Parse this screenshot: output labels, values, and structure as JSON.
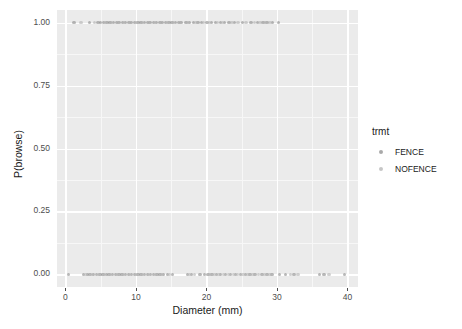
{
  "chart_data": {
    "type": "scatter",
    "title": "",
    "xlabel": "Diameter (mm)",
    "ylabel": "P(browse)",
    "xlim": [
      -1.2,
      41.5
    ],
    "ylim": [
      -0.05,
      1.05
    ],
    "xticks": [
      0,
      10,
      20,
      30,
      40
    ],
    "xtick_labels": [
      "0",
      "10",
      "20",
      "30",
      "40"
    ],
    "yticks": [
      0.0,
      0.25,
      0.5,
      0.75,
      1.0
    ],
    "ytick_labels": [
      "0.00",
      "0.25",
      "0.50",
      "0.75",
      "1.00"
    ],
    "grid": true,
    "grid_major_color": "#ffffff",
    "grid_minor_color": "#f7f7f7",
    "panel_background": "#ebebeb",
    "legend_position": "right",
    "legend_title": "trmt",
    "series": [
      {
        "name": "FENCE",
        "color": "#8c8c8c",
        "points": [
          [
            1.2,
            1.0
          ],
          [
            3.4,
            1.0
          ],
          [
            4.6,
            1.0
          ],
          [
            5.0,
            1.0
          ],
          [
            5.4,
            1.0
          ],
          [
            5.9,
            1.0
          ],
          [
            6.3,
            1.0
          ],
          [
            6.8,
            1.0
          ],
          [
            7.2,
            1.0
          ],
          [
            7.6,
            1.0
          ],
          [
            8.1,
            1.0
          ],
          [
            8.5,
            1.0
          ],
          [
            9.0,
            1.0
          ],
          [
            9.4,
            1.0
          ],
          [
            9.8,
            1.0
          ],
          [
            10.3,
            1.0
          ],
          [
            10.7,
            1.0
          ],
          [
            11.2,
            1.0
          ],
          [
            11.6,
            1.0
          ],
          [
            12.0,
            1.0
          ],
          [
            12.5,
            1.0
          ],
          [
            12.9,
            1.0
          ],
          [
            13.4,
            1.0
          ],
          [
            13.8,
            1.0
          ],
          [
            14.2,
            1.0
          ],
          [
            14.7,
            1.0
          ],
          [
            15.1,
            1.0
          ],
          [
            15.6,
            1.0
          ],
          [
            16.0,
            1.0
          ],
          [
            16.4,
            1.0
          ],
          [
            17.1,
            1.0
          ],
          [
            17.6,
            1.0
          ],
          [
            18.2,
            1.0
          ],
          [
            18.8,
            1.0
          ],
          [
            19.3,
            1.0
          ],
          [
            20.1,
            1.0
          ],
          [
            20.7,
            1.0
          ],
          [
            21.3,
            1.0
          ],
          [
            22.0,
            1.0
          ],
          [
            22.6,
            1.0
          ],
          [
            23.2,
            1.0
          ],
          [
            24.0,
            1.0
          ],
          [
            25.1,
            1.0
          ],
          [
            26.3,
            1.0
          ],
          [
            27.2,
            1.0
          ],
          [
            28.0,
            1.0
          ],
          [
            28.6,
            1.0
          ],
          [
            29.4,
            1.0
          ],
          [
            30.2,
            1.0
          ],
          [
            0.4,
            0.0
          ],
          [
            2.6,
            0.0
          ],
          [
            3.1,
            0.0
          ],
          [
            3.5,
            0.0
          ],
          [
            4.0,
            0.0
          ],
          [
            4.4,
            0.0
          ],
          [
            4.9,
            0.0
          ],
          [
            5.3,
            0.0
          ],
          [
            5.8,
            0.0
          ],
          [
            6.2,
            0.0
          ],
          [
            6.7,
            0.0
          ],
          [
            7.1,
            0.0
          ],
          [
            7.6,
            0.0
          ],
          [
            8.0,
            0.0
          ],
          [
            8.5,
            0.0
          ],
          [
            8.9,
            0.0
          ],
          [
            9.4,
            0.0
          ],
          [
            9.8,
            0.0
          ],
          [
            10.3,
            0.0
          ],
          [
            10.7,
            0.0
          ],
          [
            11.2,
            0.0
          ],
          [
            11.6,
            0.0
          ],
          [
            12.1,
            0.0
          ],
          [
            12.5,
            0.0
          ],
          [
            13.0,
            0.0
          ],
          [
            13.4,
            0.0
          ],
          [
            13.9,
            0.0
          ],
          [
            14.5,
            0.0
          ],
          [
            15.2,
            0.0
          ],
          [
            17.3,
            0.0
          ],
          [
            17.9,
            0.0
          ],
          [
            19.1,
            0.0
          ],
          [
            19.7,
            0.0
          ],
          [
            20.2,
            0.0
          ],
          [
            20.8,
            0.0
          ],
          [
            21.4,
            0.0
          ],
          [
            22.0,
            0.0
          ],
          [
            22.7,
            0.0
          ],
          [
            23.4,
            0.0
          ],
          [
            24.1,
            0.0
          ],
          [
            24.8,
            0.0
          ],
          [
            25.5,
            0.0
          ],
          [
            26.2,
            0.0
          ],
          [
            26.9,
            0.0
          ],
          [
            27.9,
            0.0
          ],
          [
            28.6,
            0.0
          ],
          [
            29.3,
            0.0
          ],
          [
            30.4,
            0.0
          ],
          [
            31.2,
            0.0
          ],
          [
            32.4,
            0.0
          ],
          [
            36.0,
            0.0
          ],
          [
            36.7,
            0.0
          ],
          [
            39.6,
            0.0
          ]
        ]
      },
      {
        "name": "NOFENCE",
        "color": "#b3b3b3",
        "points": [
          [
            2.2,
            1.0
          ],
          [
            4.1,
            1.0
          ],
          [
            5.6,
            1.0
          ],
          [
            6.5,
            1.0
          ],
          [
            7.4,
            1.0
          ],
          [
            8.3,
            1.0
          ],
          [
            9.2,
            1.0
          ],
          [
            10.0,
            1.0
          ],
          [
            10.9,
            1.0
          ],
          [
            11.8,
            1.0
          ],
          [
            12.7,
            1.0
          ],
          [
            13.6,
            1.0
          ],
          [
            14.4,
            1.0
          ],
          [
            15.3,
            1.0
          ],
          [
            16.2,
            1.0
          ],
          [
            17.4,
            1.0
          ],
          [
            18.5,
            1.0
          ],
          [
            19.6,
            1.0
          ],
          [
            20.4,
            1.0
          ],
          [
            21.6,
            1.0
          ],
          [
            22.3,
            1.0
          ],
          [
            23.6,
            1.0
          ],
          [
            24.5,
            1.0
          ],
          [
            25.6,
            1.0
          ],
          [
            26.8,
            1.0
          ],
          [
            27.6,
            1.0
          ],
          [
            28.3,
            1.0
          ],
          [
            29.0,
            1.0
          ],
          [
            2.9,
            0.0
          ],
          [
            3.8,
            0.0
          ],
          [
            4.7,
            0.0
          ],
          [
            5.5,
            0.0
          ],
          [
            6.4,
            0.0
          ],
          [
            7.3,
            0.0
          ],
          [
            8.2,
            0.0
          ],
          [
            9.1,
            0.0
          ],
          [
            10.0,
            0.0
          ],
          [
            10.9,
            0.0
          ],
          [
            11.8,
            0.0
          ],
          [
            12.8,
            0.0
          ],
          [
            13.7,
            0.0
          ],
          [
            14.8,
            0.0
          ],
          [
            17.6,
            0.0
          ],
          [
            18.3,
            0.0
          ],
          [
            20.5,
            0.0
          ],
          [
            21.1,
            0.0
          ],
          [
            21.8,
            0.0
          ],
          [
            22.4,
            0.0
          ],
          [
            23.1,
            0.0
          ],
          [
            23.8,
            0.0
          ],
          [
            24.4,
            0.0
          ],
          [
            25.2,
            0.0
          ],
          [
            25.9,
            0.0
          ],
          [
            26.6,
            0.0
          ],
          [
            27.4,
            0.0
          ],
          [
            28.2,
            0.0
          ],
          [
            29.0,
            0.0
          ],
          [
            31.9,
            0.0
          ],
          [
            33.0,
            0.0
          ],
          [
            37.4,
            0.0
          ]
        ]
      }
    ]
  },
  "legend": {
    "title": "trmt",
    "items": [
      {
        "label": "FENCE",
        "color": "#8c8c8c"
      },
      {
        "label": "NOFENCE",
        "color": "#b3b3b3"
      }
    ]
  }
}
